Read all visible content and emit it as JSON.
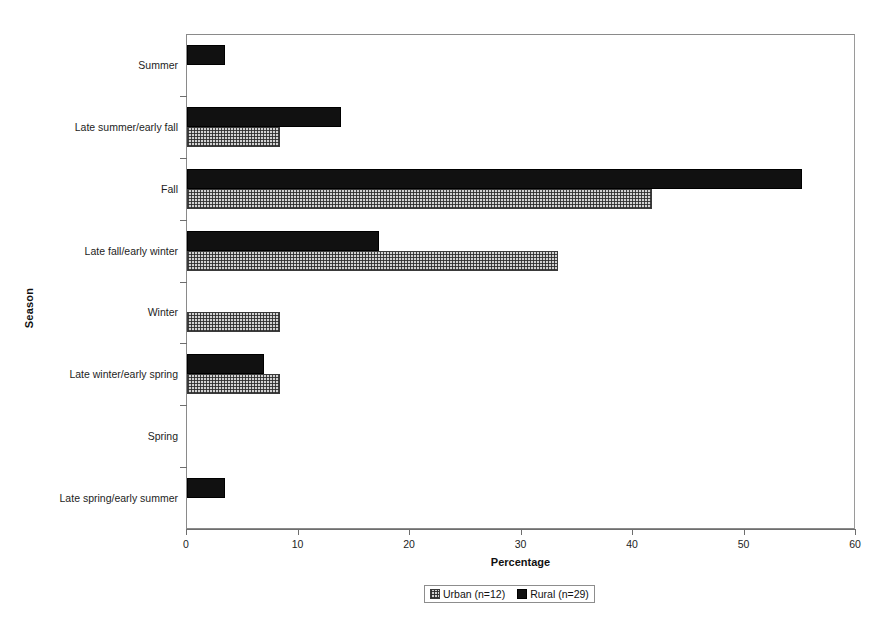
{
  "chart_data": {
    "type": "bar",
    "orientation": "horizontal",
    "title": "",
    "xlabel": "Percentage",
    "ylabel": "Season",
    "xlim": [
      0,
      60
    ],
    "xticks": [
      0,
      10,
      20,
      30,
      40,
      50,
      60
    ],
    "grid": false,
    "legend_position": "bottom-center",
    "categories": [
      "Summer",
      "Late summer/early fall",
      "Fall",
      "Late fall/early winter",
      "Winter",
      "Late winter/early spring",
      "Spring",
      "Late spring/early summer"
    ],
    "series": [
      {
        "name": "Urban (n=12)",
        "pattern": "cross-hatch",
        "color": "#d2d2d2",
        "values": [
          0,
          8.3,
          41.7,
          33.3,
          8.3,
          8.3,
          0,
          0
        ]
      },
      {
        "name": "Rural (n=29)",
        "pattern": "solid",
        "color": "#111111",
        "values": [
          3.4,
          13.8,
          55.2,
          17.2,
          0,
          6.9,
          0,
          3.4
        ]
      }
    ]
  },
  "legend": {
    "items": [
      {
        "label": "Urban (n=12)",
        "swatch": "urban-hatch-swatch"
      },
      {
        "label": "Rural (n=29)",
        "swatch": "rural-solid-swatch"
      }
    ]
  },
  "axes": {
    "x_title": "Percentage",
    "y_title": "Season",
    "x_tick_labels": [
      "0",
      "10",
      "20",
      "30",
      "40",
      "50",
      "60"
    ]
  }
}
